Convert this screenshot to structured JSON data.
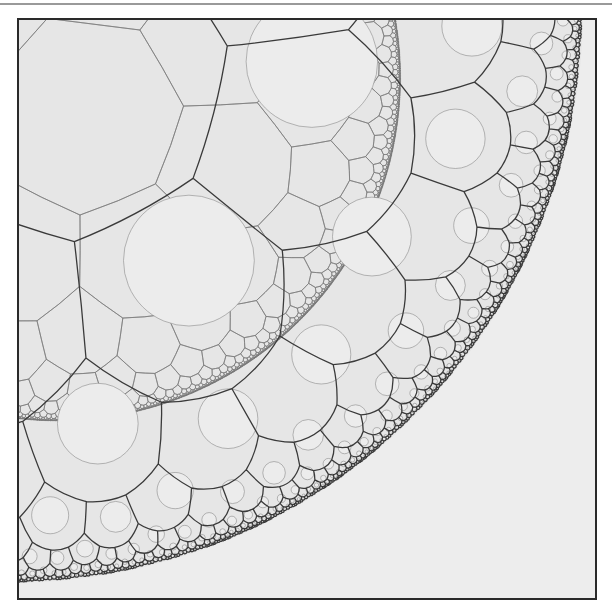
{
  "figure": {
    "background_color": "#ededed",
    "frame_color": "#2a2a2a",
    "top_rule_color": "#9a9a9a",
    "disk_fill": "#e6e6e6",
    "coarse_line_color": "#3a3a3a",
    "fine_line_color": "#7a7a7a",
    "circle_line_color": "#8a8a8a"
  },
  "geometry": {
    "frame": {
      "x": 17,
      "y": 18,
      "width": 576,
      "height": 578
    },
    "disk_center": {
      "x": 8,
      "y": 8
    },
    "disk_radius": 573,
    "coarse_tiling": {
      "p": 7,
      "q": 3,
      "depth": 6
    },
    "fine_tiling": {
      "p": 7,
      "q": 3,
      "depth": 9,
      "scale_shift": 0.42
    }
  }
}
